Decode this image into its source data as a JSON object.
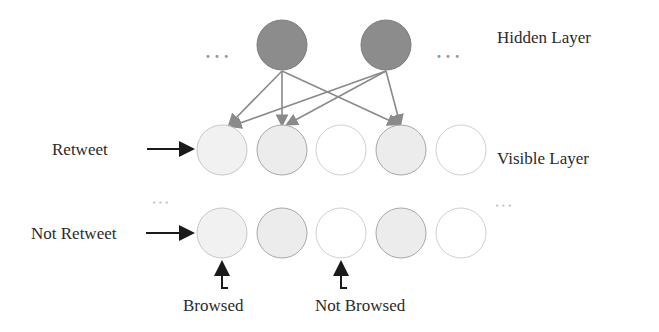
{
  "labels": {
    "hidden_layer": "Hidden Layer",
    "visible_layer": "Visible Layer",
    "retweet": "Retweet",
    "not_retweet": "Not Retweet",
    "browsed": "Browsed",
    "not_browsed": "Not Browsed",
    "ellipsis": "• • •"
  },
  "colors": {
    "hidden_fill": "#8c8c8c",
    "visible_fill_light": "#f0f0f0",
    "visible_fill_mid": "#ececec",
    "visible_fill_empty": "#ffffff",
    "edge": "#8a8a8a",
    "arrow": "#1a1a1a"
  }
}
